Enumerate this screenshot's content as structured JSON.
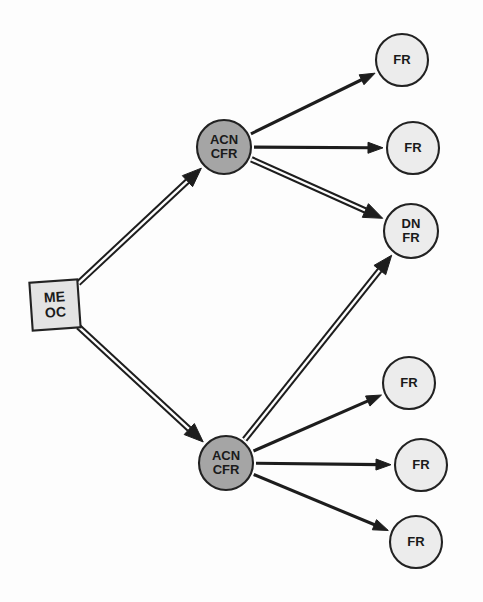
{
  "diagram": {
    "background_color": "#fdfdfd",
    "width": 483,
    "height": 602,
    "stroke_color": "#1d1d1d",
    "node_border_color": "#222222",
    "colors": {
      "root_fill": "#e3e3e3",
      "intermediate_fill": "#a5a5a5",
      "leaf_fill": "#ececec"
    },
    "nodes": [
      {
        "id": "root",
        "shape": "square",
        "line1": "ME",
        "line2": "OC",
        "cx": 55,
        "cy": 305,
        "size": 48,
        "rotation": -4,
        "fill": "#e3e3e3",
        "font_size": 14
      },
      {
        "id": "acn-top",
        "shape": "circle",
        "line1": "ACN",
        "line2": "CFR",
        "cx": 224,
        "cy": 147,
        "r": 27,
        "fill": "#a5a5a5",
        "font_size": 13
      },
      {
        "id": "acn-bottom",
        "shape": "circle",
        "line1": "ACN",
        "line2": "CFR",
        "cx": 226,
        "cy": 463,
        "r": 27,
        "fill": "#a5a5a5",
        "font_size": 13
      },
      {
        "id": "fr-1",
        "shape": "circle",
        "line1": "FR",
        "line2": "",
        "cx": 402,
        "cy": 60,
        "r": 26,
        "fill": "#ececec",
        "font_size": 13
      },
      {
        "id": "fr-2",
        "shape": "circle",
        "line1": "FR",
        "line2": "",
        "cx": 413,
        "cy": 148,
        "r": 26,
        "fill": "#ececec",
        "font_size": 13
      },
      {
        "id": "dn-fr",
        "shape": "circle",
        "line1": "DN",
        "line2": "FR",
        "cx": 411,
        "cy": 231,
        "r": 27,
        "fill": "#ececec",
        "font_size": 13
      },
      {
        "id": "fr-3",
        "shape": "circle",
        "line1": "FR",
        "line2": "",
        "cx": 409,
        "cy": 383,
        "r": 26,
        "fill": "#ececec",
        "font_size": 13
      },
      {
        "id": "fr-4",
        "shape": "circle",
        "line1": "FR",
        "line2": "",
        "cx": 421,
        "cy": 465,
        "r": 26,
        "fill": "#ececec",
        "font_size": 13
      },
      {
        "id": "fr-5",
        "shape": "circle",
        "line1": "FR",
        "line2": "",
        "cx": 416,
        "cy": 542,
        "r": 26,
        "fill": "#ececec",
        "font_size": 13
      }
    ],
    "edges": [
      {
        "id": "edge-root-to-acn-top",
        "from": "root",
        "to": "acn-top",
        "style": "double",
        "x1": 77,
        "y1": 548,
        "x2": 566,
        "y2": 178
      },
      {
        "id": "edge-root-to-acn-bottom",
        "from": "root",
        "to": "acn-bottom",
        "style": "double",
        "x1": 77,
        "y1": 348,
        "x2": 566,
        "y2": 178
      },
      {
        "id": "edge-acn-top-to-fr-1",
        "from": "acn-top",
        "to": "fr-1",
        "style": "single",
        "x1": 263,
        "y1": 133,
        "x2": 359,
        "y2": 76
      },
      {
        "id": "edge-acn-top-to-fr-2",
        "from": "acn-top",
        "to": "fr-2",
        "style": "single",
        "x1": 263,
        "y1": 148,
        "x2": 378,
        "y2": 148
      },
      {
        "id": "edge-acn-top-to-dn-fr",
        "from": "acn-top",
        "to": "dn-fr",
        "style": "double",
        "x1": 263,
        "y1": 168,
        "x2": 371,
        "y2": 226
      },
      {
        "id": "edge-acn-bottom-to-dn-fr",
        "from": "acn-bottom",
        "to": "dn-fr",
        "style": "double",
        "x1": 241,
        "y1": 437,
        "x2": 382,
        "y2": 263
      },
      {
        "id": "edge-acn-bottom-to-fr-3",
        "from": "acn-bottom",
        "to": "fr-3",
        "style": "single",
        "x1": 265,
        "y1": 450,
        "x2": 366,
        "y2": 395
      },
      {
        "id": "edge-acn-bottom-to-fr-4",
        "from": "acn-bottom",
        "to": "fr-4",
        "style": "single",
        "x1": 265,
        "y1": 465,
        "x2": 387,
        "y2": 465
      },
      {
        "id": "edge-acn-bottom-to-fr-5",
        "from": "acn-bottom",
        "to": "fr-5",
        "style": "single",
        "x1": 263,
        "y1": 483,
        "x2": 374,
        "y2": 536
      }
    ]
  }
}
